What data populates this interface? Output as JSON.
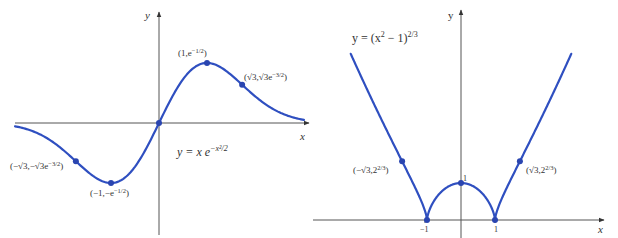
{
  "chart_data": [
    {
      "type": "line",
      "title": "y = x e^{-x^2/2}",
      "equation_label": "y = x e",
      "equation_exponent": "−x²/2",
      "xlabel": "x",
      "ylabel": "y",
      "function": "x*exp(-x^2/2)",
      "xlim": [
        -3.0,
        3.02
      ],
      "grid": false,
      "legend": "none",
      "points": [
        {
          "x": -1.732,
          "y": -0.386,
          "label": "(−√3,−√3e",
          "label_exp": "−3/2",
          "label_end": ")"
        },
        {
          "x": -1,
          "y": -0.607,
          "label": "(−1,−e",
          "label_exp": "−1/2",
          "label_end": ")"
        },
        {
          "x": 0,
          "y": 0,
          "label": ""
        },
        {
          "x": 1,
          "y": 0.607,
          "label": "(1,e",
          "label_exp": "−1/2",
          "label_end": ")"
        },
        {
          "x": 1.732,
          "y": 0.386,
          "label": "(√3,√3e",
          "label_exp": "−3/2",
          "label_end": ")"
        }
      ],
      "layout": {
        "origin_px": [
          159,
          123
        ],
        "x_scale": 48,
        "y_scale": 99,
        "x_axis_px": [
          15,
          309
        ],
        "y_axis_px": [
          235,
          12
        ]
      }
    },
    {
      "type": "line",
      "title": "y = (x^2 − 1)^{2/3}",
      "equation_label": "y = (x",
      "equation_sq": "2",
      "equation_mid": " − 1)",
      "equation_exponent": "2/3",
      "xlabel": "x",
      "ylabel": "y",
      "function": "(x^2-1)^(2/3)",
      "ylim_top": 4.49,
      "grid": false,
      "legend": "none",
      "ticks": [
        {
          "x": -1,
          "label": "−1"
        },
        {
          "x": 1,
          "label": "1"
        }
      ],
      "y_tick_label": "1",
      "points": [
        {
          "x": -1.732,
          "y": 1.587,
          "label": "(−√3,2",
          "label_exp": "2/3",
          "label_end": ")"
        },
        {
          "x": -1,
          "y": 0,
          "label": ""
        },
        {
          "x": 0,
          "y": 1,
          "label": ""
        },
        {
          "x": 1,
          "y": 0,
          "label": ""
        },
        {
          "x": 1.732,
          "y": 1.587,
          "label": "(√3,2",
          "label_exp": "2/3",
          "label_end": ")"
        }
      ],
      "layout": {
        "origin_px": [
          461,
          220
        ],
        "x_scale": 34,
        "y_scale": 37,
        "x_axis_px": [
          313,
          604
        ],
        "y_axis_px": [
          238,
          10
        ]
      }
    }
  ],
  "colors": {
    "curve": "#2f4fc0",
    "point": "#2a45b0",
    "axis": "#555555",
    "text": "#333333"
  }
}
